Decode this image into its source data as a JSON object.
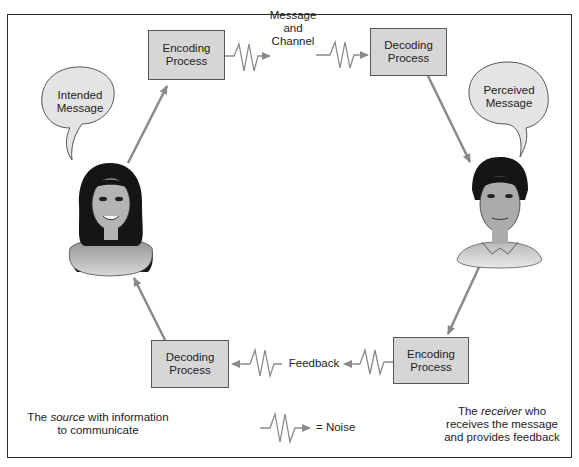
{
  "boxes": {
    "encoding_top": {
      "line1": "Encoding",
      "line2": "Process"
    },
    "decoding_top": {
      "line1": "Decoding",
      "line2": "Process"
    },
    "decoding_bottom": {
      "line1": "Decoding",
      "line2": "Process"
    },
    "encoding_bottom": {
      "line1": "Encoding",
      "line2": "Process"
    }
  },
  "channel_label": {
    "line1": "Message",
    "line2": "and",
    "line3": "Channel"
  },
  "feedback_label": "Feedback",
  "bubbles": {
    "intended": {
      "line1": "Intended",
      "line2": "Message"
    },
    "perceived": {
      "line1": "Perceived",
      "line2": "Message"
    }
  },
  "source_caption": {
    "pre": "The ",
    "em": "source",
    "post": " with information",
    "line2": "to communicate"
  },
  "receiver_caption": {
    "pre": "The ",
    "em": "receiver",
    "post": " who",
    "line2": "receives the message",
    "line3": "and provides feedback"
  },
  "legend": {
    "noise_label": "= Noise",
    "icon": "noise-zigzag-icon"
  },
  "people": {
    "source": "woman-figure",
    "receiver": "man-figure"
  },
  "colors": {
    "box_fill": "#d6d6d6",
    "arrow": "#8a8a8a",
    "bubble_fill": "#e4e4e4",
    "frame": "#2a2a2a"
  }
}
